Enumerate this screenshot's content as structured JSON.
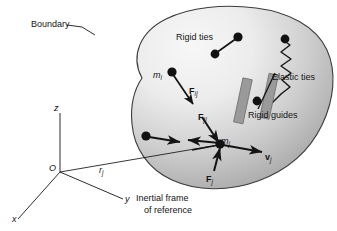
{
  "figure": {
    "background_color": "#ffffff",
    "blob_fill_light": "#f2f2f2",
    "blob_fill_dark": "#a8a8a8",
    "blob_stroke": "#3c3c3c",
    "ink_color": "#141414",
    "guide_fill": "#9a9a9a",
    "guide_stroke": "#6a6a6a"
  },
  "labels": {
    "boundary": "Boundary",
    "rigid_ties": "Rigid ties",
    "elastic_ties": "Elastic ties",
    "rigid_guides": "Rigid guides",
    "inertial_frame_line1": "Inertial frame",
    "inertial_frame_line2": "of reference"
  },
  "axes": {
    "origin": "O",
    "z": "z",
    "y": "y",
    "x": "x"
  },
  "symbols": {
    "mass_i": {
      "base": "m",
      "sub": "i"
    },
    "mass_j": {
      "base": "m",
      "sub": "j"
    },
    "force_ij": {
      "base": "F",
      "sub": "ij"
    },
    "force_ji": {
      "base": "F",
      "sub": "ji"
    },
    "force_j": {
      "base": "F",
      "sub": "j"
    },
    "velocity_j": {
      "base": "v",
      "sub": "j"
    },
    "position_j": {
      "base": "r",
      "sub": "j"
    }
  },
  "caption": " "
}
